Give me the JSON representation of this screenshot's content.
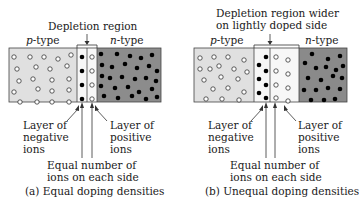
{
  "panel_a": {
    "title": "Depletion region",
    "p_label_italic": "p",
    "p_label_rest": "-type",
    "n_label_italic": "n",
    "n_label_rest": "-type",
    "left_label": [
      "Layer of",
      "negative",
      "ions"
    ],
    "right_label": [
      "Layer of",
      "positive",
      "ions"
    ],
    "bottom_label": [
      "Equal number of",
      "ions on each side"
    ],
    "caption": "(a) Equal doping densities"
  },
  "panel_b": {
    "title": [
      "Depletion region wider",
      "on lightly doped side"
    ],
    "p_label_italic": "p",
    "p_label_rest": "-type",
    "n_label_italic": "n",
    "n_label_rest": "-type",
    "left_label": [
      "Layer of",
      "negative",
      "ions"
    ],
    "right_label": [
      "Layer of",
      "positive",
      "ions"
    ],
    "bottom_label": [
      "Equal number of",
      "ions on each side"
    ],
    "caption": "(b) Unequal doping densities"
  },
  "colors": {
    "p_region": "#e0e0e0",
    "n_region_a": "#8c8c8c",
    "n_region_b": "#8a8a8a",
    "depletion": "#f7f7f7",
    "ion_fill_negative": "#000000",
    "hole_fill": "#ffffff",
    "outline": "#333333"
  }
}
